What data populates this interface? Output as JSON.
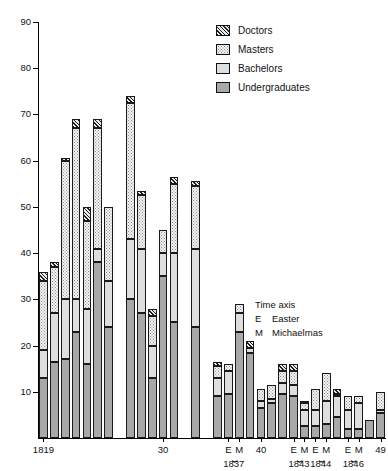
{
  "chart_data": {
    "type": "bar",
    "subtype": "stacked-bar",
    "title": "",
    "xlabel": "Time axis",
    "ylabel": "",
    "ylim": [
      0,
      90
    ],
    "yticks": [
      10,
      20,
      30,
      40,
      50,
      60,
      70,
      80,
      90
    ],
    "grid": false,
    "legend_position": "top-right",
    "series": [
      {
        "name": "Undergraduates",
        "values": [
          13,
          16.5,
          17,
          23,
          16,
          38,
          24,
          30,
          27,
          13,
          35,
          25,
          24,
          9,
          9.5,
          23,
          18.5,
          6.5,
          7.5,
          9.5,
          9,
          2.5,
          2.5,
          3,
          4.5,
          2,
          2,
          4,
          5.5
        ]
      },
      {
        "name": "Bachelors",
        "values": [
          6,
          10.5,
          13,
          7,
          12,
          3,
          10,
          13,
          14,
          7,
          5,
          15,
          17,
          4,
          5,
          4,
          1,
          1.5,
          1,
          2.5,
          2.5,
          3.5,
          3.5,
          5,
          4.5,
          4,
          5.5,
          0,
          0.5
        ]
      },
      {
        "name": "Masters",
        "values": [
          15,
          10,
          30,
          37,
          19,
          26,
          16,
          29.5,
          11.5,
          6.5,
          5,
          15,
          13.5,
          2.5,
          1.5,
          2,
          0,
          2.5,
          3,
          2.5,
          3,
          1.5,
          4.5,
          6,
          0.5,
          3,
          1.5,
          0,
          4
        ]
      },
      {
        "name": "Doctors",
        "values": [
          2,
          1,
          0.5,
          2,
          3,
          2,
          0,
          1.5,
          1,
          1.5,
          0,
          1.5,
          1,
          1,
          0,
          0,
          1.5,
          0,
          0,
          1.5,
          1.5,
          0.5,
          0,
          0,
          1,
          0,
          0,
          0,
          0
        ]
      }
    ],
    "legend_entries": [
      "Doctors",
      "Masters",
      "Bachelors",
      "Undergraduates"
    ],
    "x_tick_labels": [
      {
        "text": "1819",
        "value": 0
      },
      {
        "text": "30",
        "value": 10
      },
      {
        "text": "E",
        "value": 14
      },
      {
        "text": "M",
        "value": 15
      },
      {
        "text": "40",
        "value": 17
      },
      {
        "text": "E",
        "value": 20
      },
      {
        "text": "M",
        "value": 21
      },
      {
        "text": "E",
        "value": 22
      },
      {
        "text": "M",
        "value": 23
      },
      {
        "text": "E",
        "value": 25
      },
      {
        "text": "M",
        "value": 26
      },
      {
        "text": "49",
        "value": 28
      }
    ],
    "x_group_labels": [
      {
        "text": "1837"
      },
      {
        "text": "1843"
      },
      {
        "text": "1844"
      },
      {
        "text": "1846"
      }
    ],
    "annotations": {
      "time_axis": "Time axis",
      "easter_key": "E",
      "easter_label": "Easter",
      "michaelmas_key": "M",
      "michaelmas_label": "Michaelmas"
    }
  },
  "colors": {
    "undergraduates": "#a8a8a8",
    "bachelors": "#dedede",
    "masters": "#f4f4f4",
    "doctors": "#9a9a9a",
    "axis": "#000000",
    "background": "#ffffff"
  }
}
